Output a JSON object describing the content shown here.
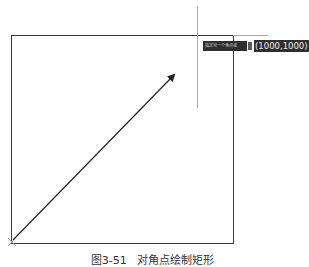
{
  "drawing": {
    "rectangle": {
      "x1": 11,
      "y1": 35,
      "x2": 233,
      "y2": 242,
      "stroke": "#3a3a3a"
    },
    "arrow": {
      "from": [
        13,
        240
      ],
      "to": [
        175,
        74
      ],
      "color": "#222222"
    },
    "crosshair_color": "#a8a8a8",
    "start_marker": "x-marker"
  },
  "tooltip": {
    "prompt": "指定另一个角点或",
    "icon": "dropdown-icon",
    "coordinate_value": "(1000,1000)"
  },
  "caption": "图3-51   对角点绘制矩形"
}
